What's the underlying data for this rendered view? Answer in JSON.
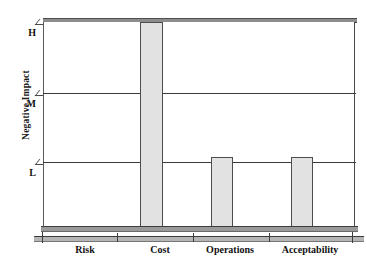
{
  "chart_data": {
    "type": "bar",
    "title": "",
    "subtitle": "",
    "xlabel": "",
    "ylabel": "Negative Impact",
    "categories": [
      "Risk",
      "Cost",
      "Operations",
      "Acceptability"
    ],
    "values": [
      0,
      3,
      1.1,
      1.1
    ],
    "value_labels": [
      "",
      "H",
      "L",
      "L"
    ],
    "ytick_labels": [
      "L",
      "M",
      "H"
    ],
    "ytick_values": [
      1,
      2,
      3
    ],
    "ylim": [
      0,
      3.15
    ],
    "grid": true,
    "legend": "none",
    "series": [
      {
        "name": "Negative Impact",
        "values": [
          0,
          3,
          1.1,
          1.1
        ]
      }
    ],
    "annotations": [],
    "colors": {
      "bar_fill": "#e2e2e2",
      "bar_border": "#4d4d4d",
      "axis": "#3b3b3b",
      "text": "#111111",
      "plot_3d_face": "#9a9a9a",
      "background": "#ffffff"
    }
  },
  "axis": {
    "y_title": "Negative Impact",
    "y_ticks": [
      {
        "label": "H",
        "top": 27,
        "mark_top": 19
      },
      {
        "label": "M",
        "top": 98,
        "mark_top": 90
      },
      {
        "label": "L",
        "top": 167,
        "mark_top": 159
      }
    ],
    "x_ticks": [
      42,
      117,
      193,
      269,
      352
    ],
    "x_labels": [
      {
        "text": "Risk",
        "left": 50,
        "width": 70
      },
      {
        "text": "Cost",
        "left": 125,
        "width": 70
      },
      {
        "text": "Operations",
        "left": 190,
        "width": 80
      },
      {
        "text": "Acceptability",
        "left": 263,
        "width": 94
      }
    ]
  },
  "bars": [
    {
      "name": "bar-risk",
      "category": "Risk",
      "left": 66,
      "top": 226,
      "width": 22,
      "height": 0,
      "visible": false
    },
    {
      "name": "bar-cost",
      "category": "Cost",
      "left": 140,
      "top": 22,
      "width": 23,
      "height": 205,
      "visible": true
    },
    {
      "name": "bar-operations",
      "category": "Operations",
      "left": 211,
      "top": 157,
      "width": 22,
      "height": 70,
      "visible": true
    },
    {
      "name": "bar-acceptability",
      "category": "Acceptability",
      "left": 291,
      "top": 157,
      "width": 22,
      "height": 70,
      "visible": true
    }
  ],
  "gridlines": [
    {
      "name": "gridline-M",
      "top": 93
    },
    {
      "name": "gridline-L",
      "top": 162
    }
  ]
}
